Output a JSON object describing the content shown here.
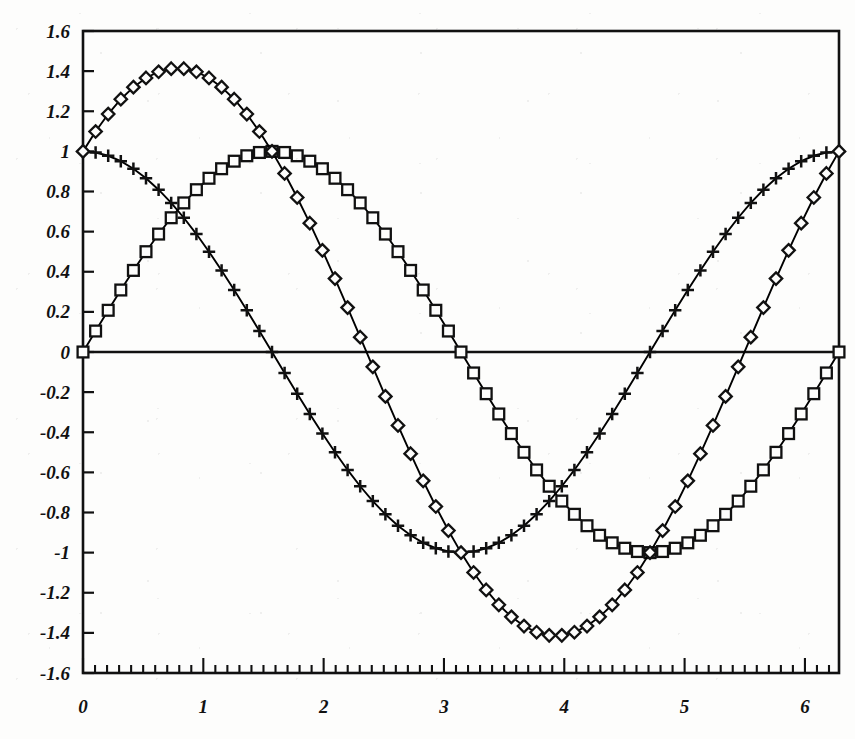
{
  "chart_data": {
    "type": "line",
    "title": "",
    "subtitle": "",
    "xlabel": "",
    "ylabel": "",
    "xlim": [
      0,
      6.2832
    ],
    "ylim": [
      -1.6,
      1.6
    ],
    "grid": false,
    "legend": "none",
    "x_tick_labels": [
      "0",
      "1",
      "2",
      "3",
      "4",
      "5",
      "6"
    ],
    "x_tick_values": [
      0,
      1,
      2,
      3,
      4,
      5,
      6
    ],
    "x_minor_tick_step": 0.1,
    "y_tick_labels": [
      "1.6",
      "1.4",
      "1.2",
      "1",
      "0.8",
      "0.6",
      "0.4",
      "0.2",
      "0",
      "-0.2",
      "-0.4",
      "-0.6",
      "-0.8",
      "-1",
      "-1.2",
      "-1.4",
      "-1.6"
    ],
    "y_tick_values": [
      1.6,
      1.4,
      1.2,
      1,
      0.8,
      0.6,
      0.4,
      0.2,
      0,
      -0.2,
      -0.4,
      -0.6,
      -0.8,
      -1,
      -1.2,
      -1.4,
      -1.6
    ],
    "zero_line": 0,
    "n_points": 61,
    "series": [
      {
        "name": "cos(x)",
        "marker": "plus",
        "color": "#000000",
        "x": [
          0,
          0.1047,
          0.2094,
          0.3142,
          0.4189,
          0.5236,
          0.6283,
          0.733,
          0.8378,
          0.9425,
          1.0472,
          1.1519,
          1.2566,
          1.3614,
          1.4661,
          1.5708,
          1.6755,
          1.7802,
          1.885,
          1.9897,
          2.0944,
          2.1991,
          2.3038,
          2.4086,
          2.5133,
          2.618,
          2.7227,
          2.8274,
          2.9322,
          3.0369,
          3.1416,
          3.2463,
          3.351,
          3.4558,
          3.5605,
          3.6652,
          3.7699,
          3.8746,
          3.9794,
          4.0841,
          4.1888,
          4.2935,
          4.3982,
          4.5029,
          4.6077,
          4.7124,
          4.8171,
          4.9218,
          5.0265,
          5.1313,
          5.236,
          5.3407,
          5.4454,
          5.5501,
          5.6549,
          5.7596,
          5.8643,
          5.969,
          6.0737,
          6.1785,
          6.2832
        ],
        "y": [
          1,
          0.9945,
          0.9781,
          0.9511,
          0.9135,
          0.866,
          0.809,
          0.7431,
          0.6691,
          0.5878,
          0.5,
          0.4067,
          0.309,
          0.2079,
          0.1045,
          0,
          -0.1045,
          -0.2079,
          -0.309,
          -0.4067,
          -0.5,
          -0.5878,
          -0.6691,
          -0.7431,
          -0.809,
          -0.866,
          -0.9135,
          -0.9511,
          -0.9781,
          -0.9945,
          -1,
          -0.9945,
          -0.9781,
          -0.9511,
          -0.9135,
          -0.866,
          -0.809,
          -0.7431,
          -0.6691,
          -0.5878,
          -0.5,
          -0.4067,
          -0.309,
          -0.2079,
          -0.1045,
          0,
          0.1045,
          0.2079,
          0.309,
          0.4067,
          0.5,
          0.5878,
          0.6691,
          0.7431,
          0.809,
          0.866,
          0.9135,
          0.9511,
          0.9781,
          0.9945,
          1
        ]
      },
      {
        "name": "sin(x)",
        "marker": "square",
        "color": "#000000",
        "x": [
          0,
          0.1047,
          0.2094,
          0.3142,
          0.4189,
          0.5236,
          0.6283,
          0.733,
          0.8378,
          0.9425,
          1.0472,
          1.1519,
          1.2566,
          1.3614,
          1.4661,
          1.5708,
          1.6755,
          1.7802,
          1.885,
          1.9897,
          2.0944,
          2.1991,
          2.3038,
          2.4086,
          2.5133,
          2.618,
          2.7227,
          2.8274,
          2.9322,
          3.0369,
          3.1416,
          3.2463,
          3.351,
          3.4558,
          3.5605,
          3.6652,
          3.7699,
          3.8746,
          3.9794,
          4.0841,
          4.1888,
          4.2935,
          4.3982,
          4.5029,
          4.6077,
          4.7124,
          4.8171,
          4.9218,
          5.0265,
          5.1313,
          5.236,
          5.3407,
          5.4454,
          5.5501,
          5.6549,
          5.7596,
          5.8643,
          5.969,
          6.0737,
          6.1785,
          6.2832
        ],
        "y": [
          0,
          0.1045,
          0.2079,
          0.309,
          0.4067,
          0.5,
          0.5878,
          0.6691,
          0.7431,
          0.809,
          0.866,
          0.9135,
          0.9511,
          0.9781,
          0.9945,
          1,
          0.9945,
          0.9781,
          0.9511,
          0.9135,
          0.866,
          0.809,
          0.7431,
          0.6691,
          0.5878,
          0.5,
          0.4067,
          0.309,
          0.2079,
          0.1045,
          0,
          -0.1045,
          -0.2079,
          -0.309,
          -0.4067,
          -0.5,
          -0.5878,
          -0.6691,
          -0.7431,
          -0.809,
          -0.866,
          -0.9135,
          -0.9511,
          -0.9781,
          -0.9945,
          -1,
          -0.9945,
          -0.9781,
          -0.9511,
          -0.9135,
          -0.866,
          -0.809,
          -0.7431,
          -0.6691,
          -0.5878,
          -0.5,
          -0.4067,
          -0.309,
          -0.2079,
          -0.1045,
          0
        ]
      },
      {
        "name": "sin(x)+cos(x)",
        "marker": "diamond",
        "color": "#000000",
        "x": [
          0,
          0.1047,
          0.2094,
          0.3142,
          0.4189,
          0.5236,
          0.6283,
          0.733,
          0.8378,
          0.9425,
          1.0472,
          1.1519,
          1.2566,
          1.3614,
          1.4661,
          1.5708,
          1.6755,
          1.7802,
          1.885,
          1.9897,
          2.0944,
          2.1991,
          2.3038,
          2.4086,
          2.5133,
          2.618,
          2.7227,
          2.8274,
          2.9322,
          3.0369,
          3.1416,
          3.2463,
          3.351,
          3.4558,
          3.5605,
          3.6652,
          3.7699,
          3.8746,
          3.9794,
          4.0841,
          4.1888,
          4.2935,
          4.3982,
          4.5029,
          4.6077,
          4.7124,
          4.8171,
          4.9218,
          5.0265,
          5.1313,
          5.236,
          5.3407,
          5.4454,
          5.5501,
          5.6549,
          5.7596,
          5.8643,
          5.969,
          6.0737,
          6.1785,
          6.2832
        ],
        "y": [
          1,
          1.099,
          1.186,
          1.2601,
          1.3202,
          1.366,
          1.3968,
          1.4122,
          1.4122,
          1.3968,
          1.366,
          1.3202,
          1.2601,
          1.186,
          1.099,
          1,
          0.89,
          0.7702,
          0.6421,
          0.5068,
          0.366,
          0.2212,
          0.074,
          -0.074,
          -0.2212,
          -0.366,
          -0.5068,
          -0.6421,
          -0.7702,
          -0.89,
          -1,
          -1.099,
          -1.186,
          -1.2601,
          -1.3202,
          -1.366,
          -1.3968,
          -1.4122,
          -1.4122,
          -1.3968,
          -1.366,
          -1.3202,
          -1.2601,
          -1.186,
          -1.099,
          -1,
          -0.89,
          -0.7702,
          -0.6421,
          -0.5068,
          -0.366,
          -0.2212,
          -0.074,
          0.074,
          0.2212,
          0.366,
          0.5068,
          0.6421,
          0.7702,
          0.89,
          1
        ]
      }
    ]
  },
  "axes": {
    "frame_color": "#111111",
    "background": "#fdfdfc"
  }
}
